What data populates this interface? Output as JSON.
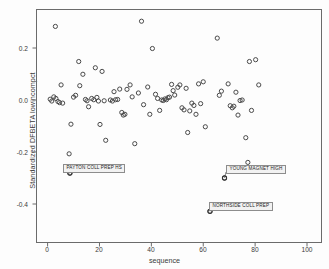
{
  "chart_data": {
    "type": "scatter",
    "title": "",
    "xlabel": "sequence",
    "ylabel": "Standardized DFBETA lowincompct",
    "xlim": [
      -4,
      107
    ],
    "ylim": [
      -0.5,
      0.3
    ],
    "xticks": [
      0,
      20,
      40,
      60,
      80,
      100
    ],
    "xtick_labels": [
      "0",
      "20",
      "40",
      "60",
      "80",
      "100"
    ],
    "yticks": [
      0.2,
      0.0,
      -0.2,
      -0.4
    ],
    "ytick_labels": [
      "0.2",
      "0.0",
      "-0.2",
      "-0.4"
    ],
    "grid": false,
    "legend": null,
    "marker": "open-circle",
    "marker_color": "#4a4a4a",
    "points": [
      {
        "x": 1,
        "y": 0.003
      },
      {
        "x": 1.6,
        "y": -0.004
      },
      {
        "x": 2.4,
        "y": 0.012
      },
      {
        "x": 3.2,
        "y": 0.006
      },
      {
        "x": 4.0,
        "y": -0.006
      },
      {
        "x": 4.6,
        "y": -0.01
      },
      {
        "x": 5.2,
        "y": 0.058
      },
      {
        "x": 5.8,
        "y": -0.012
      },
      {
        "x": 3.0,
        "y": 0.283
      },
      {
        "x": 8.3,
        "y": -0.207
      },
      {
        "x": 8.6,
        "y": -0.281
      },
      {
        "x": 9.0,
        "y": -0.093
      },
      {
        "x": 10.0,
        "y": 0.011
      },
      {
        "x": 10.8,
        "y": 0.018
      },
      {
        "x": 12.0,
        "y": 0.148
      },
      {
        "x": 12.4,
        "y": 0.055
      },
      {
        "x": 13.6,
        "y": 0.099
      },
      {
        "x": 14.6,
        "y": 0.002
      },
      {
        "x": 15.2,
        "y": -0.003
      },
      {
        "x": 15.8,
        "y": -0.026
      },
      {
        "x": 17.0,
        "y": 0.006
      },
      {
        "x": 17.8,
        "y": 0.001
      },
      {
        "x": 18.4,
        "y": 0.124
      },
      {
        "x": 19.0,
        "y": 0.01
      },
      {
        "x": 19.6,
        "y": -0.004
      },
      {
        "x": 20.2,
        "y": -0.094
      },
      {
        "x": 21.0,
        "y": 0.11
      },
      {
        "x": 21.8,
        "y": -0.003
      },
      {
        "x": 22.4,
        "y": -0.155
      },
      {
        "x": 24.2,
        "y": 0.0
      },
      {
        "x": 25.0,
        "y": -0.004
      },
      {
        "x": 25.6,
        "y": 0.032
      },
      {
        "x": 26.2,
        "y": 0.001
      },
      {
        "x": 27.0,
        "y": 0.002
      },
      {
        "x": 27.8,
        "y": 0.042
      },
      {
        "x": 28.6,
        "y": -0.048
      },
      {
        "x": 29.2,
        "y": -0.058
      },
      {
        "x": 29.8,
        "y": -0.055
      },
      {
        "x": 30.6,
        "y": 0.041
      },
      {
        "x": 31.8,
        "y": 0.058
      },
      {
        "x": 32.6,
        "y": 0.012
      },
      {
        "x": 33.6,
        "y": -0.168
      },
      {
        "x": 35.0,
        "y": 0.027
      },
      {
        "x": 36.2,
        "y": 0.303
      },
      {
        "x": 37.0,
        "y": -0.018
      },
      {
        "x": 38.6,
        "y": 0.05
      },
      {
        "x": 39.4,
        "y": -0.055
      },
      {
        "x": 40.4,
        "y": 0.198
      },
      {
        "x": 41.6,
        "y": 0.022
      },
      {
        "x": 42.4,
        "y": 0.006
      },
      {
        "x": 43.2,
        "y": -0.04
      },
      {
        "x": 44.0,
        "y": 0.0
      },
      {
        "x": 44.6,
        "y": -0.002
      },
      {
        "x": 45.2,
        "y": 0.004
      },
      {
        "x": 45.8,
        "y": 0.001
      },
      {
        "x": 46.4,
        "y": 0.009
      },
      {
        "x": 47.0,
        "y": 0.011
      },
      {
        "x": 47.8,
        "y": 0.06
      },
      {
        "x": 48.4,
        "y": 0.036
      },
      {
        "x": 49.0,
        "y": 0.019
      },
      {
        "x": 50.2,
        "y": 0.049
      },
      {
        "x": 51.0,
        "y": 0.058
      },
      {
        "x": 51.8,
        "y": -0.03
      },
      {
        "x": 52.6,
        "y": -0.038
      },
      {
        "x": 53.4,
        "y": 0.045
      },
      {
        "x": 54.0,
        "y": -0.125
      },
      {
        "x": 54.8,
        "y": -0.042
      },
      {
        "x": 55.6,
        "y": -0.012
      },
      {
        "x": 56.4,
        "y": -0.021
      },
      {
        "x": 57.2,
        "y": -0.055
      },
      {
        "x": 58.2,
        "y": 0.062
      },
      {
        "x": 59.0,
        "y": -0.014
      },
      {
        "x": 60.0,
        "y": 0.07
      },
      {
        "x": 60.8,
        "y": -0.103
      },
      {
        "x": 62.6,
        "y": -0.428
      },
      {
        "x": 65.4,
        "y": 0.238
      },
      {
        "x": 66.2,
        "y": 0.018
      },
      {
        "x": 67.0,
        "y": 0.034
      },
      {
        "x": 68.2,
        "y": -0.3
      },
      {
        "x": 69.6,
        "y": 0.062
      },
      {
        "x": 70.4,
        "y": -0.022
      },
      {
        "x": 71.2,
        "y": -0.03
      },
      {
        "x": 71.8,
        "y": -0.024
      },
      {
        "x": 72.6,
        "y": 0.03
      },
      {
        "x": 73.4,
        "y": -0.058
      },
      {
        "x": 74.2,
        "y": -0.002
      },
      {
        "x": 75.0,
        "y": 0.0
      },
      {
        "x": 76.4,
        "y": -0.145
      },
      {
        "x": 77.2,
        "y": -0.24
      },
      {
        "x": 77.8,
        "y": 0.148
      },
      {
        "x": 78.6,
        "y": -0.04
      },
      {
        "x": 80.2,
        "y": 0.155
      },
      {
        "x": 81.4,
        "y": 0.058
      }
    ],
    "annotations": [
      {
        "id": "payton",
        "label": "PAYTON COLL PREP HS",
        "point_x": 8.6,
        "point_y": -0.281
      },
      {
        "id": "young",
        "label": "YOUNG MAGNET HIGH",
        "point_x": 68.2,
        "point_y": -0.3
      },
      {
        "id": "northside",
        "label": "NORTHSIDE COLL PREP",
        "point_x": 62.6,
        "point_y": -0.428
      }
    ]
  },
  "axes": {
    "x_title": "sequence",
    "y_title": "Standardized DFBETA lowincompct",
    "x_ticks": [
      "0",
      "20",
      "40",
      "60",
      "80",
      "100"
    ],
    "y_ticks": [
      "0.2",
      "0.0",
      "-0.2",
      "-0.4"
    ]
  },
  "annotations": {
    "payton": "PAYTON COLL PREP HS",
    "young": "YOUNG MAGNET HIGH",
    "northside": "NORTHSIDE COLL PREP"
  },
  "colors": {
    "marker": "#4a4a4a",
    "frame": "#6b6b6b",
    "text": "#3a3a3a",
    "callout_bg": "#f2f2f2",
    "callout_border": "#8d8d8d"
  }
}
